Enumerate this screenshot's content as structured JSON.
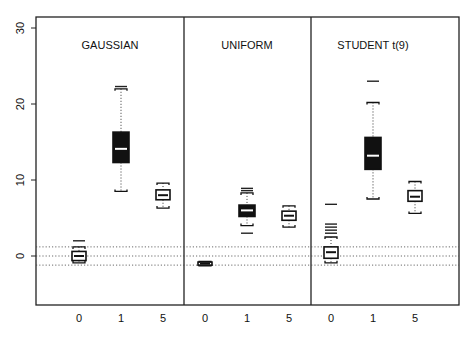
{
  "chart_data": {
    "type": "box",
    "title": "",
    "xlabel": "",
    "ylabel": "",
    "ylim": [
      -5,
      31
    ],
    "yticks": [
      0,
      10,
      20,
      30
    ],
    "grid": false,
    "reference_lines": [
      -1.2,
      0,
      1.2
    ],
    "categories": [
      "0",
      "1",
      "5"
    ],
    "panels": [
      {
        "name": "GAUSSIAN",
        "boxes": [
          {
            "category": "0",
            "whisker_low": -0.9,
            "q1": -0.6,
            "median": 0.0,
            "q3": 0.6,
            "whisker_high": 1.2,
            "outliers": [
              2.0
            ],
            "filled": false
          },
          {
            "category": "1",
            "whisker_low": 8.5,
            "q1": 12.3,
            "median": 14.1,
            "q3": 16.3,
            "whisker_high": 22.0,
            "outliers": [
              22.3
            ],
            "filled": true
          },
          {
            "category": "5",
            "whisker_low": 6.3,
            "q1": 7.4,
            "median": 8.0,
            "q3": 8.7,
            "whisker_high": 9.6,
            "outliers": [],
            "filled": false
          }
        ]
      },
      {
        "name": "UNIFORM",
        "boxes": [
          {
            "category": "0",
            "whisker_low": -1.3,
            "q1": -1.2,
            "median": -1.0,
            "q3": -0.8,
            "whisker_high": -0.7,
            "outliers": [],
            "filled": false
          },
          {
            "category": "1",
            "whisker_low": 4.0,
            "q1": 5.2,
            "median": 6.0,
            "q3": 6.7,
            "whisker_high": 8.3,
            "outliers": [
              3.0,
              8.6,
              8.9
            ],
            "filled": true
          },
          {
            "category": "5",
            "whisker_low": 3.8,
            "q1": 4.7,
            "median": 5.3,
            "q3": 5.9,
            "whisker_high": 6.6,
            "outliers": [],
            "filled": false
          }
        ]
      },
      {
        "name": "STUDENT t(9)",
        "boxes": [
          {
            "category": "0",
            "whisker_low": -0.9,
            "q1": -0.3,
            "median": 0.5,
            "q3": 1.2,
            "whisker_high": 2.5,
            "outliers": [
              3.0,
              3.4,
              3.8,
              4.2,
              6.8
            ],
            "filled": false
          },
          {
            "category": "1",
            "whisker_low": 7.5,
            "q1": 11.4,
            "median": 13.2,
            "q3": 15.6,
            "whisker_high": 20.2,
            "outliers": [
              23.0
            ],
            "filled": true
          },
          {
            "category": "5",
            "whisker_low": 5.6,
            "q1": 7.2,
            "median": 7.8,
            "q3": 8.6,
            "whisker_high": 9.8,
            "outliers": [],
            "filled": false
          }
        ]
      }
    ]
  },
  "labels": {
    "panel_titles": [
      "GAUSSIAN",
      "UNIFORM",
      "STUDENT t(9)"
    ],
    "x_ticks": [
      "0",
      "1",
      "5",
      "0",
      "1",
      "5",
      "0",
      "1",
      "5"
    ],
    "y_ticks": [
      "0",
      "10",
      "20",
      "30"
    ]
  }
}
